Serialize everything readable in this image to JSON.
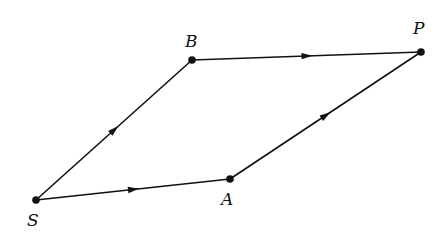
{
  "diagram": {
    "type": "parallelogram-vector-diagram",
    "points": [
      {
        "id": "S",
        "label": "S",
        "x": 36,
        "y": 200,
        "lx": 27,
        "ly": 226
      },
      {
        "id": "A",
        "label": "A",
        "x": 230,
        "y": 179,
        "lx": 221,
        "ly": 205
      },
      {
        "id": "B",
        "label": "B",
        "x": 192,
        "y": 60,
        "lx": 185,
        "ly": 47
      },
      {
        "id": "P",
        "label": "P",
        "x": 421,
        "y": 52,
        "lx": 413,
        "ly": 34
      }
    ],
    "edges": [
      {
        "from": "S",
        "to": "A",
        "arrow": "midpoint"
      },
      {
        "from": "A",
        "to": "P",
        "arrow": "midpoint"
      },
      {
        "from": "S",
        "to": "B",
        "arrow": "midpoint"
      },
      {
        "from": "B",
        "to": "P",
        "arrow": "midpoint"
      }
    ],
    "colors": {
      "stroke": "#111111",
      "background": "#ffffff"
    }
  }
}
